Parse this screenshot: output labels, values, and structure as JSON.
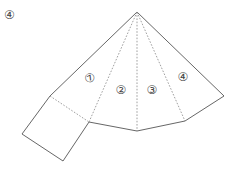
{
  "figure": {
    "number_label": "④",
    "colors": {
      "line": "#555555",
      "fold": "#888888",
      "text": "#444444",
      "background": "#ffffff"
    },
    "faces": [
      {
        "id": "face-1",
        "label": "⑦",
        "x": 90,
        "y": 78,
        "rotate": -30
      },
      {
        "id": "face-2",
        "label": "②",
        "x": 121,
        "y": 90,
        "rotate": 0
      },
      {
        "id": "face-3",
        "label": "③",
        "x": 152,
        "y": 90,
        "rotate": 0
      },
      {
        "id": "face-4",
        "label": "④",
        "x": 183,
        "y": 77,
        "rotate": 0
      }
    ],
    "vertices": {
      "apex": [
        137,
        12
      ],
      "left": [
        50,
        96
      ],
      "b1": [
        89,
        122
      ],
      "b2": [
        137,
        131
      ],
      "b3": [
        185,
        121
      ],
      "right": [
        224,
        96
      ],
      "square_bl": [
        22,
        134
      ],
      "square_br": [
        63,
        161
      ]
    }
  }
}
